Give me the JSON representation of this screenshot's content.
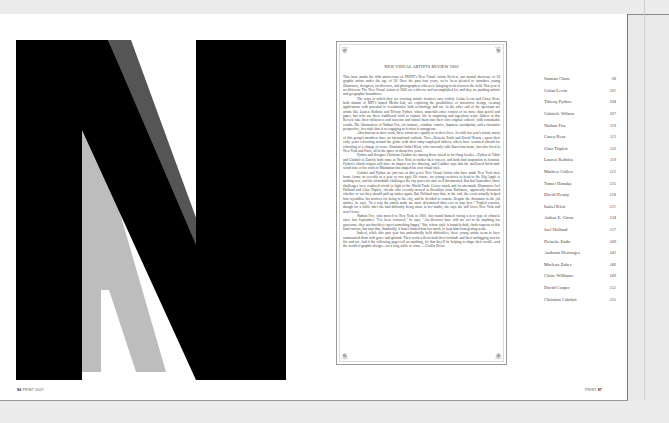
{
  "spread": {
    "folio_left": {
      "page": "96",
      "label": "PRINT 2007"
    },
    "folio_right": {
      "label": "PRINT",
      "page": "97"
    },
    "display_letter": "N"
  },
  "article": {
    "title": "NEW VISUAL ARTISTS REVIEW 2002",
    "paragraphs": [
      "This issue marks the fifth anniversary of PRINT's New Visual Artists Review, our annual showcase of 20 graphic artists under the age of 30. Over the past four years, we've been pleased to introduce young illustrators, designers, art directors, and photographers who were bringing fresh vision to the field. This year is no different: The New Visual Artists of 2002 are a diverse and accomplished lot, and they are pushing artistic and geographic boundaries.",
      "The ways in which they are crossing artistic frontiers vary widely. Golan Levin and Casey Reas, both alumni of MIT's famed Media Lab, are exploring the possibilities of interactive design, creating applications with potential to revolutionize both technology and art. At the other end of the spectrum are artists like Lauren Redniss and Tiffeny Pythos, whose materials often consist of no more than pencil and paper, but who use these traditional tools to capture life in surprising and ingenious ways. Others in this Review take their influences and interests and funnel them into their own original esthetic, with remarkable results. The illustrations of Nathan Fox, for instance, combine comics, Japanese woodprints, and a cinematic perspective, in a style that is as engaging as it often is outrageous.",
      "Adventurous in their work, these artists are equally so in their lives. As with last year's artists, many of this group's members have an international outlook. Two—Deineke Endo and David Heasty—spent their early years relocating around the globe with their army-employed fathers; others have ventured abroad for schooling or a change of scene. Illustrator Isabel Klett, who currently calls Barcelona home, has also lived in New York and Paris, all in the space of about five years.",
      "Pythos and designer Christian Calabrò are among those raised in far-flung locales—Pythos in Tahiti and Calabrò in Zurich; both came to New York to further their careers, and both find inspiration in location. Pythos's island origins still have an impact on her drawing, and Calabrò says that the mellowed brick-and-wood tone of his work in Manhattan has shaped his own visual style.",
      "Calabrò and Pythos are just two of this year's New Visual Artists who have made New York their home (some as recently as a year or two ago). Of course, for young creatives to head to the Big Apple is nothing new, and the formidable challenges the city poses are also well documented. But last September, those challenges were rendered trivial in light of the World Trade Center attack and its aftermath. Illustrators Joel Holland and Gina Triplett, friends who recently moved to Brooklyn from Baltimore, apparently discussed whether or not they should pull up stakes again. But Holland says that, in the end, the event actually helped him crystallize his motives for being in the city, and he decided to remain. Despite the downturn in the job market, he says, \"In a way the attack made me more determined than ever to stay here.\" Triplett concurs, though for a while after she had difficulty being alone in her studio, she says she still loves New York and won't leave.",
      "Nathan Fox, who moved to New York in 2001, has found himself facing a new type of obstacle since last September: \"I've been censored,\" he says. \"Art directors have told me not to do anything too gruesome; they say that they expect something happy.\" But, whose style is innately dark, finds requests of this kind curious, but says that, thankfully, it hasn't limited him too much, or kept him from getting work.",
      "Indeed, while this past year has undoubtedly held difficulties, these young artists seem to have surmounted them with grace and aplomb. Their work reflects both their fortitude and their unflagging zest for life and art. And if the following pages tell us anything, it's that they'll be helping to shape their world—and the world of graphic design—for a long while to come."
    ],
    "signature": "—Caitlin Dover"
  },
  "contents": [
    {
      "name": "Saiman Chow",
      "page": "98"
    },
    {
      "name": "Golan Levin",
      "page": "101"
    },
    {
      "name": "Tiffeny Pythos",
      "page": "104"
    },
    {
      "name": "Gabriele Wilson",
      "page": "107"
    },
    {
      "name": "Nathan Fox",
      "page": "110"
    },
    {
      "name": "Casey Reas",
      "page": "113"
    },
    {
      "name": "Gina Triplett",
      "page": "116"
    },
    {
      "name": "Lauren Redniss",
      "page": "119"
    },
    {
      "name": "Mathew Cullen",
      "page": "122"
    },
    {
      "name": "Tomer Hanuka",
      "page": "125"
    },
    {
      "name": "David Heasty",
      "page": "128"
    },
    {
      "name": "Isabel Klett",
      "page": "131"
    },
    {
      "name": "Arthur E. Giron",
      "page": "134"
    },
    {
      "name": "Joel Holland",
      "page": "137"
    },
    {
      "name": "Deineke Endo",
      "page": "140"
    },
    {
      "name": "Audouin Desforges",
      "page": "143"
    },
    {
      "name": "Marlena Zuber",
      "page": "146"
    },
    {
      "name": "Claire Williams",
      "page": "149"
    },
    {
      "name": "David Cooper",
      "page": "152"
    },
    {
      "name": "Christian Calabrò",
      "page": "155"
    }
  ]
}
